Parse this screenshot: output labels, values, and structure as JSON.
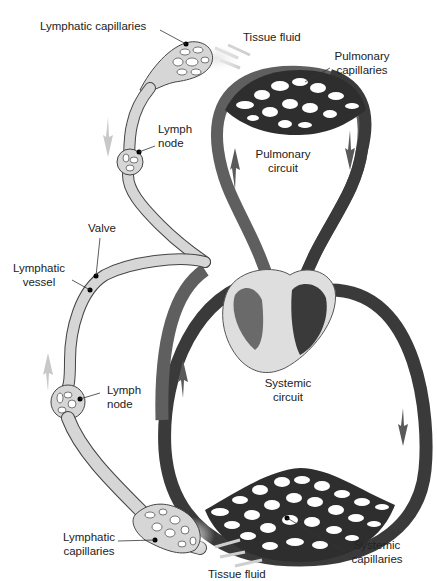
{
  "diagram": {
    "colors": {
      "deoxygenated_vessel": "#5f5f5f",
      "oxygenated_vessel": "#3a3a3a",
      "lymph_vessel": "#d6d6d6",
      "heart_fill": "#dedede",
      "flow_arrow_light": "#c8c8c8"
    },
    "labels": {
      "lymphatic_capillaries_top": "Lymphatic capillaries",
      "tissue_fluid_top": "Tissue fluid",
      "pulmonary_capillaries_1": "Pulmonary",
      "pulmonary_capillaries_2": "capillaries",
      "lymph_node_top_1": "Lymph",
      "lymph_node_top_2": "node",
      "pulmonary_circuit_1": "Pulmonary",
      "pulmonary_circuit_2": "circuit",
      "valve": "Valve",
      "lymphatic_vessel_1": "Lymphatic",
      "lymphatic_vessel_2": "vessel",
      "lymph_node_bottom_1": "Lymph",
      "lymph_node_bottom_2": "node",
      "systemic_circuit_1": "Systemic",
      "systemic_circuit_2": "circuit",
      "lymphatic_capillaries_bottom_1": "Lymphatic",
      "lymphatic_capillaries_bottom_2": "capillaries",
      "systemic_capillaries_1": "Systemic",
      "systemic_capillaries_2": "capillaries",
      "tissue_fluid_bottom": "Tissue fluid"
    }
  }
}
